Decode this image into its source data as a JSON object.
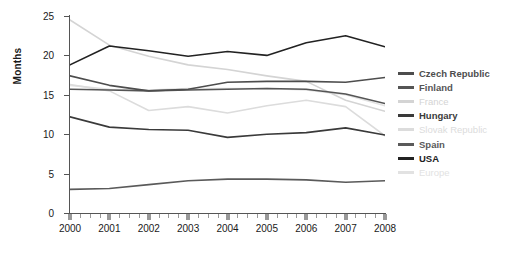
{
  "chart_data": {
    "type": "line",
    "title": "",
    "xlabel": "",
    "ylabel": "Months",
    "x": [
      2000,
      2001,
      2002,
      2003,
      2004,
      2005,
      2006,
      2007,
      2008
    ],
    "xtick_labels": [
      "2000",
      "2001",
      "2002",
      "2003",
      "2004",
      "2005",
      "2006",
      "2007",
      "2008"
    ],
    "ytick_labels": [
      "0",
      "5",
      "10",
      "15",
      "20",
      "25"
    ],
    "yticks": [
      0,
      5,
      10,
      15,
      20,
      25
    ],
    "ylim": [
      0,
      25
    ],
    "xlim": [
      2000,
      2008
    ],
    "grid": false,
    "legend_position": "right",
    "series": [
      {
        "name": "Czech Republic",
        "color": "#4d4d4d",
        "values": [
          17.4,
          16.2,
          15.5,
          15.7,
          16.6,
          16.7,
          16.7,
          16.6,
          17.2
        ]
      },
      {
        "name": "Finland",
        "color": "#555555",
        "values": [
          15.7,
          15.6,
          15.5,
          15.6,
          15.7,
          15.8,
          15.7,
          15.1,
          13.9
        ]
      },
      {
        "name": "France",
        "color": "#d4d4d4",
        "values": [
          24.5,
          21.3,
          19.9,
          18.8,
          18.2,
          17.4,
          16.7,
          14.3,
          12.9
        ]
      },
      {
        "name": "Hungary",
        "color": "#3a3a3a",
        "values": [
          12.2,
          10.9,
          10.6,
          10.5,
          9.6,
          10.0,
          10.2,
          10.8,
          9.9
        ]
      },
      {
        "name": "Slovak Republic",
        "color": "#dcdcdc",
        "values": [
          16.3,
          15.5,
          13.0,
          13.5,
          12.7,
          13.6,
          14.3,
          13.5,
          9.8
        ]
      },
      {
        "name": "Spain",
        "color": "#5a5a5a",
        "values": [
          3.0,
          3.1,
          3.6,
          4.1,
          4.3,
          4.3,
          4.2,
          3.9,
          4.1
        ]
      },
      {
        "name": "USA",
        "color": "#222222",
        "values": [
          18.8,
          21.2,
          20.6,
          19.9,
          20.5,
          20.0,
          21.6,
          22.5,
          21.1
        ]
      },
      {
        "name": "Europe",
        "color": "#e2e2e2",
        "values": [
          16.2,
          15.7,
          15.6,
          15.8,
          15.8,
          15.8,
          15.6,
          15.0,
          13.6
        ]
      }
    ]
  }
}
